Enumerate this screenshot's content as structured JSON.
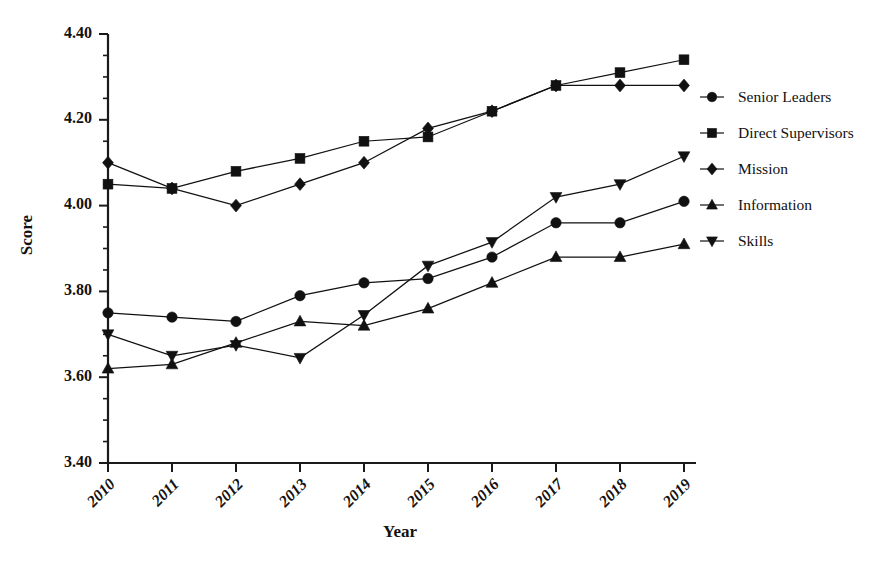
{
  "chart_data": {
    "type": "line",
    "title": "",
    "xlabel": "Year",
    "ylabel": "Score",
    "categories": [
      "2010",
      "2011",
      "2012",
      "2013",
      "2014",
      "2015",
      "2016",
      "2017",
      "2018",
      "2019"
    ],
    "ylim": [
      3.4,
      4.4
    ],
    "ytick_labels": [
      "3.40",
      "3.60",
      "3.80",
      "4.00",
      "4.20",
      "4.40"
    ],
    "ytick_values": [
      3.4,
      3.6,
      3.8,
      4.0,
      4.2,
      4.4
    ],
    "yminor_step": 0.05,
    "grid": false,
    "legend_position": "right",
    "series": [
      {
        "name": "Senior Leaders",
        "marker": "circle",
        "color": "#111111",
        "values": [
          3.75,
          3.74,
          3.73,
          3.79,
          3.82,
          3.83,
          3.88,
          3.96,
          3.96,
          4.01
        ]
      },
      {
        "name": "Direct Supervisors",
        "marker": "square",
        "color": "#111111",
        "values": [
          4.05,
          4.04,
          4.08,
          4.11,
          4.15,
          4.16,
          4.22,
          4.28,
          4.31,
          4.34
        ]
      },
      {
        "name": "Mission",
        "marker": "diamond",
        "color": "#111111",
        "values": [
          4.1,
          4.04,
          4.0,
          4.05,
          4.1,
          4.18,
          4.22,
          4.28,
          4.28,
          4.28
        ]
      },
      {
        "name": "Information",
        "marker": "triangle-up",
        "color": "#111111",
        "values": [
          3.62,
          3.63,
          3.68,
          3.73,
          3.72,
          3.76,
          3.82,
          3.88,
          3.88,
          3.91
        ]
      },
      {
        "name": "Skills",
        "marker": "triangle-down",
        "color": "#111111",
        "values": [
          3.7,
          3.65,
          3.675,
          3.645,
          3.745,
          3.86,
          3.915,
          4.02,
          4.05,
          4.115
        ]
      }
    ]
  }
}
